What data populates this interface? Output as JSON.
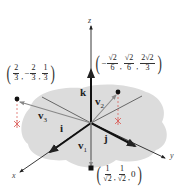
{
  "diagram": {
    "axes": {
      "x_label": "x",
      "y_label": "y",
      "z_label": "z"
    },
    "unit_vectors": {
      "i": "i",
      "j": "j",
      "k": "k"
    },
    "vectors": [
      {
        "name": "v",
        "index": "1",
        "point_label": {
          "open": "(",
          "c1_num": "1",
          "c1_den": "√2",
          "sep1": ",",
          "c2_num": "1",
          "c2_den": "√2",
          "sep2": ",",
          "c3": "0",
          "close": ")"
        },
        "coords": [
          "1/√2",
          "1/√2",
          "0"
        ]
      },
      {
        "name": "v",
        "index": "2",
        "point_label": {
          "open": "(",
          "c1_sign": "−",
          "c1_num": "√2",
          "c1_den": "6",
          "sep1": ",",
          "c2_num": "√2",
          "c2_den": "6",
          "sep2": ",",
          "c3_num": "2√2",
          "c3_den": "3",
          "close": ")"
        },
        "coords": [
          "-√2/6",
          "√2/6",
          "2√2/3"
        ]
      },
      {
        "name": "v",
        "index": "3",
        "point_label": {
          "open": "(",
          "c1_num": "2",
          "c1_den": "3",
          "sep1": ",",
          "c2_sign": "−",
          "c2_num": "2",
          "c2_den": "3",
          "sep2": ",",
          "c3_num": "1",
          "c3_den": "3",
          "close": ")"
        },
        "coords": [
          "2/3",
          "-2/3",
          "1/3"
        ]
      }
    ],
    "colors": {
      "plane": "#d9d9d9",
      "axis": "#222222",
      "vector": "#9a9a9a",
      "projection_marker": "#d9534f",
      "point": "#111111"
    }
  }
}
